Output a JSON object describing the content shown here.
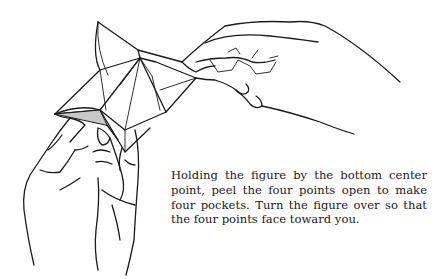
{
  "illustration": {
    "subject": "hands-peeling-origami-figure",
    "description_icons": [
      "left-hand-icon",
      "right-hand-icon",
      "origami-figure-icon"
    ]
  },
  "caption": {
    "lines": [
      "Holding the figure by the bottom center",
      "point, peel the four points open to make",
      "four pockets. Turn the figure over so that",
      "the four points face toward you."
    ]
  },
  "colors": {
    "ink": "#1a1a1a",
    "shade": "#c8c8c8",
    "paper": "#ffffff"
  }
}
